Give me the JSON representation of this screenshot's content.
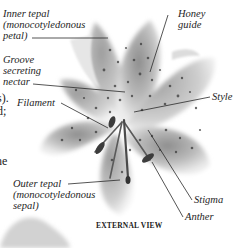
{
  "diagram": {
    "title": "EXTERNAL VIEW",
    "labels": {
      "inner_tepal": [
        "Inner tepal",
        "(monocotyledonous",
        "petal)"
      ],
      "groove": [
        "Groove",
        "secreting",
        "nectar"
      ],
      "filament": "Filament",
      "honey_guide": [
        "Honey",
        "guide"
      ],
      "style": "Style",
      "outer_tepal": [
        "Outer tepal",
        "(monocotyledonous",
        "sepal)"
      ],
      "stigma": "Stigma",
      "anther": "Anther"
    },
    "cropped_text_fragments": [
      "s).",
      "d;",
      "ne"
    ],
    "colors": {
      "background": "#ffffff",
      "petal_light": "#d9d9d9",
      "petal_mid": "#9a9a9a",
      "spots": "#3a3a3a",
      "leader_line": "#2a2a2a",
      "text": "#1e1e1e"
    }
  }
}
